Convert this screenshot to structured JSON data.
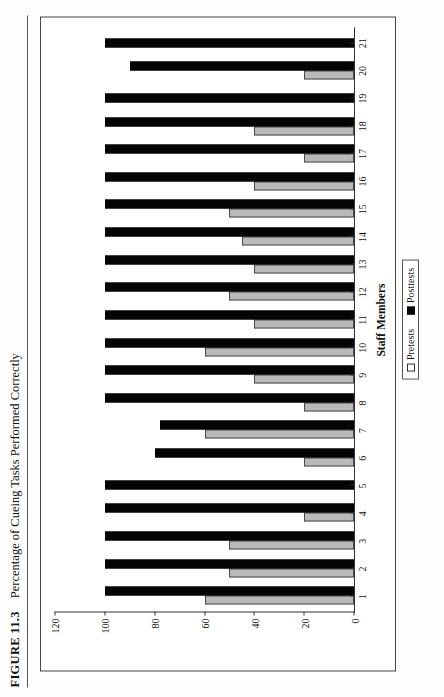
{
  "figure": {
    "number": "FIGURE 11.3",
    "title": "Percentage of Cueing Tasks Performed Correctly"
  },
  "chart_data": {
    "type": "bar",
    "title": "Percentage of Cueing Tasks Performed Correctly",
    "xlabel": "Staff Members",
    "ylabel": "Percentage",
    "ylim": [
      0,
      120
    ],
    "yticks": [
      0,
      20,
      40,
      60,
      80,
      100,
      120
    ],
    "grid": false,
    "legend_position": "bottom-center",
    "orientation": "vertical-bars-rotated-90ccw-on-page",
    "categories": [
      "1",
      "2",
      "3",
      "4",
      "5",
      "6",
      "7",
      "8",
      "9",
      "10",
      "11",
      "12",
      "13",
      "14",
      "15",
      "16",
      "17",
      "18",
      "19",
      "20",
      "21"
    ],
    "series": [
      {
        "name": "Pretests",
        "color": "#b9b9b9",
        "values": [
          60,
          50,
          50,
          20,
          0,
          20,
          60,
          20,
          40,
          60,
          40,
          50,
          40,
          45,
          50,
          40,
          20,
          40,
          0,
          20,
          0
        ]
      },
      {
        "name": "Posttests",
        "color": "#050505",
        "values": [
          100,
          100,
          100,
          100,
          100,
          80,
          78,
          100,
          100,
          100,
          100,
          100,
          100,
          100,
          100,
          100,
          100,
          100,
          100,
          90,
          100
        ]
      }
    ]
  },
  "legend": {
    "items": [
      {
        "label": "Pretests",
        "swatch": "open-square-icon"
      },
      {
        "label": "Posttests",
        "swatch": "filled-square-icon"
      }
    ]
  }
}
